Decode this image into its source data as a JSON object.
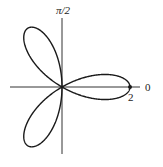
{
  "chart_data": {
    "type": "line",
    "subtype": "polar",
    "equation": "r = 2cos(3θ)",
    "title": "",
    "curve": "three-petal rose",
    "petals": 3,
    "max_r": 2,
    "petal_angles": [
      "0",
      "2π/3",
      "4π/3"
    ],
    "axis_labels": {
      "polar_axis": "0",
      "vertical_axis": "π/2"
    },
    "tick_labels": [
      {
        "label": "2",
        "position": "r = 2 on polar axis (θ = 0)"
      }
    ],
    "marked_points": [
      {
        "r": 2,
        "theta": 0,
        "label": "2"
      }
    ],
    "grid": false,
    "legend": null,
    "colors": {
      "curve": "#1a1a1a",
      "axes": "#333333",
      "background": "#ffffff"
    }
  },
  "labels": {
    "vertical_axis": "π/2",
    "polar_axis": "0",
    "tick_r2": "2"
  }
}
